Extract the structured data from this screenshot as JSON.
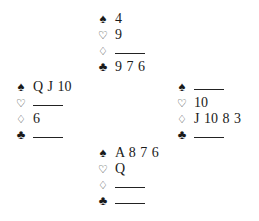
{
  "suit_symbols": {
    "spades": "♠",
    "hearts": "♡",
    "diamonds": "♢",
    "clubs": "♣"
  },
  "void_marker": "—",
  "hands": {
    "north": {
      "spades": "4",
      "hearts": "9",
      "diamonds": "",
      "clubs": "9 7 6"
    },
    "west": {
      "spades": "Q J 10",
      "hearts": "",
      "diamonds": "6",
      "clubs": ""
    },
    "east": {
      "spades": "",
      "hearts": "10",
      "diamonds": "J 10 8 3",
      "clubs": ""
    },
    "south": {
      "spades": "A 8 7 6",
      "hearts": "Q",
      "diamonds": "",
      "clubs": ""
    }
  }
}
